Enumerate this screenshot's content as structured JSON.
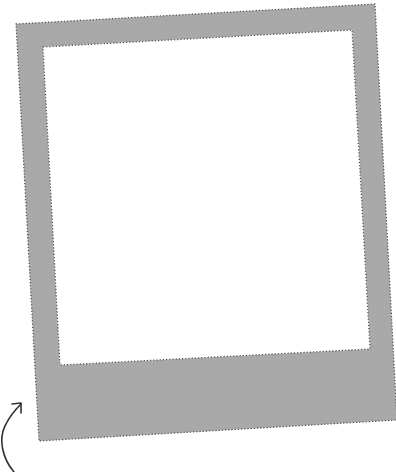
{
  "frame": {
    "type": "instant-photo-frame",
    "fill_color": "#a8a8a8",
    "border_color": "#4a4a4a",
    "photo_area_color": "#ffffff",
    "outer_corners": [
      [
        16,
        24
      ],
      [
        375,
        4
      ],
      [
        397,
        420
      ],
      [
        39,
        441
      ]
    ],
    "inner_corners": [
      [
        43,
        47
      ],
      [
        352,
        30
      ],
      [
        370,
        349
      ],
      [
        60,
        365
      ]
    ]
  },
  "arrow": {
    "icon": "curved-arrow-icon",
    "color": "#333333"
  }
}
